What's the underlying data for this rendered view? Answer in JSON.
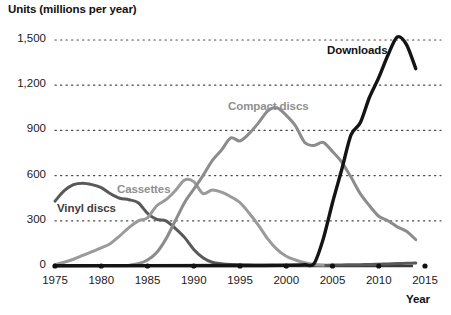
{
  "chart_data": {
    "type": "line",
    "title": "",
    "ylabel": "Units (millions per year)",
    "xlabel": "Year",
    "xlim": [
      1975,
      2015
    ],
    "ylim": [
      0,
      1500
    ],
    "grid": true,
    "legend_position": "inline-labels",
    "y_ticks": [
      0,
      300,
      600,
      900,
      1200,
      1500
    ],
    "y_tick_labels": [
      "0",
      "300",
      "600",
      "900",
      "1,200",
      "1,500"
    ],
    "x_ticks": [
      1975,
      1980,
      1985,
      1990,
      1995,
      2000,
      2005,
      2010,
      2015
    ],
    "x_tick_labels": [
      "1975",
      "1980",
      "1985",
      "1990",
      "1995",
      "2000",
      "2005",
      "2010",
      "2015"
    ],
    "series": [
      {
        "name": "Vinyl discs",
        "color": "#595959",
        "label_color": "#3d3d3d",
        "x": [
          1975,
          1976,
          1977,
          1978,
          1979,
          1980,
          1981,
          1982,
          1983,
          1984,
          1985,
          1986,
          1987,
          1988,
          1989,
          1990,
          1991,
          1992,
          1993,
          1994,
          1995,
          1996,
          1997,
          1998,
          1999,
          2000,
          2001,
          2002,
          2003,
          2004,
          2005,
          2006,
          2007,
          2008,
          2009,
          2010,
          2011,
          2012,
          2013,
          2014
        ],
        "values": [
          430,
          500,
          540,
          550,
          540,
          520,
          480,
          450,
          440,
          420,
          350,
          310,
          300,
          250,
          190,
          110,
          55,
          25,
          15,
          10,
          8,
          6,
          5,
          5,
          4,
          4,
          4,
          4,
          4,
          5,
          6,
          7,
          8,
          9,
          10,
          12,
          14,
          16,
          18,
          20
        ]
      },
      {
        "name": "Cassettes",
        "color": "#9a9a9a",
        "label_color": "#8f8f8f",
        "x": [
          1975,
          1976,
          1977,
          1978,
          1979,
          1980,
          1981,
          1982,
          1983,
          1984,
          1985,
          1986,
          1987,
          1988,
          1989,
          1990,
          1991,
          1992,
          1993,
          1994,
          1995,
          1996,
          1997,
          1998,
          1999,
          2000,
          2001,
          2002,
          2003,
          2004
        ],
        "values": [
          10,
          25,
          45,
          70,
          95,
          120,
          150,
          200,
          255,
          300,
          320,
          400,
          440,
          500,
          570,
          560,
          480,
          505,
          490,
          460,
          420,
          350,
          270,
          180,
          110,
          65,
          40,
          22,
          10,
          5
        ]
      },
      {
        "name": "Compact discs",
        "color": "#8c8c8c",
        "label_color": "#8f8f8f",
        "x": [
          1983,
          1984,
          1985,
          1986,
          1987,
          1988,
          1989,
          1990,
          1991,
          1992,
          1993,
          1994,
          1995,
          1996,
          1997,
          1998,
          1999,
          2000,
          2001,
          2002,
          2003,
          2004,
          2005,
          2006,
          2007,
          2008,
          2009,
          2010,
          2011,
          2012,
          2013,
          2014
        ],
        "values": [
          5,
          15,
          40,
          90,
          180,
          300,
          420,
          510,
          600,
          700,
          770,
          850,
          830,
          880,
          950,
          1030,
          1050,
          1000,
          930,
          820,
          800,
          820,
          760,
          690,
          590,
          480,
          400,
          330,
          300,
          260,
          230,
          175
        ]
      },
      {
        "name": "Downloads",
        "color": "#141414",
        "label_color": "#111111",
        "x": [
          1975,
          1995,
          2000,
          2002,
          2003,
          2004,
          2005,
          2006,
          2007,
          2008,
          2009,
          2010,
          2011,
          2012,
          2013,
          2014
        ],
        "values": [
          2,
          3,
          5,
          8,
          15,
          180,
          420,
          640,
          870,
          950,
          1120,
          1250,
          1400,
          1520,
          1470,
          1310
        ]
      }
    ],
    "series_labels": [
      {
        "text": "Vinyl discs",
        "color": "#3d3d3d",
        "left": 57,
        "top": 202
      },
      {
        "text": "Cassettes",
        "color": "#8f8f8f",
        "left": 117,
        "top": 183
      },
      {
        "text": "Compact discs",
        "color": "#8f8f8f",
        "left": 228,
        "top": 100
      },
      {
        "text": "Downloads",
        "color": "#111111",
        "left": 327,
        "top": 44
      }
    ]
  }
}
